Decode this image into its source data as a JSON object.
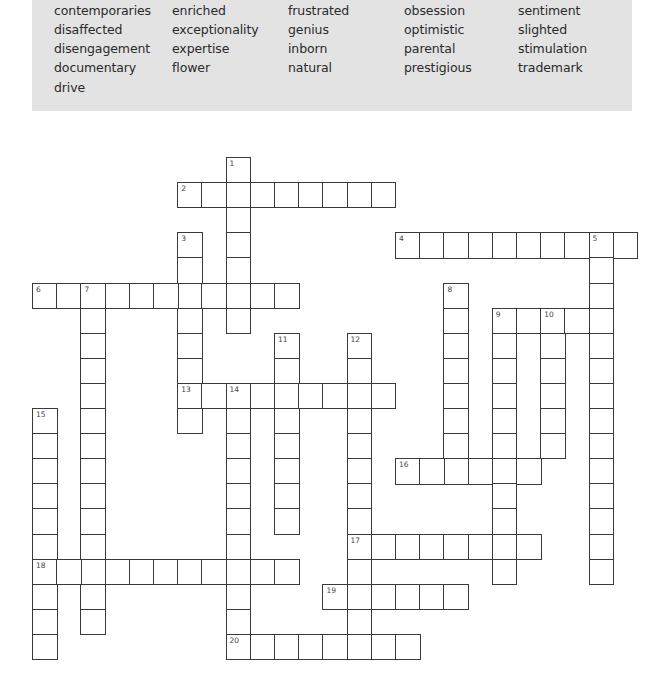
{
  "word_bank": {
    "columns": [
      [
        "contemporaries",
        "disaffected",
        "disengagement",
        "documentary",
        "drive"
      ],
      [
        "enriched",
        "exceptionality",
        "expertise",
        "flower"
      ],
      [
        "frustrated",
        "genius",
        "inborn",
        "natural"
      ],
      [
        "obsession",
        "optimistic",
        "parental",
        "prestigious"
      ],
      [
        "sentiment",
        "slighted",
        "stimulation",
        "trademark"
      ]
    ]
  },
  "crossword": {
    "grid": {
      "origin_x": 32,
      "origin_y": 157,
      "cell_w": 24.2,
      "cell_h": 25.1
    },
    "entries": [
      {
        "number": "1",
        "dir": "down",
        "row": 0,
        "col": 8,
        "length": 7
      },
      {
        "number": "2",
        "dir": "across",
        "row": 1,
        "col": 6,
        "length": 9
      },
      {
        "number": "3",
        "dir": "down",
        "row": 3,
        "col": 6,
        "length": 8
      },
      {
        "number": "4",
        "dir": "across",
        "row": 3,
        "col": 15,
        "length": 10
      },
      {
        "number": "5",
        "dir": "down",
        "row": 3,
        "col": 23,
        "length": 14
      },
      {
        "number": "6",
        "dir": "across",
        "row": 5,
        "col": 0,
        "length": 11
      },
      {
        "number": "7",
        "dir": "down",
        "row": 5,
        "col": 2,
        "length": 14
      },
      {
        "number": "8",
        "dir": "down",
        "row": 5,
        "col": 17,
        "length": 8
      },
      {
        "number": "9",
        "dir": "across",
        "row": 6,
        "col": 19,
        "length": 5
      },
      {
        "number": "9",
        "dir": "down",
        "row": 6,
        "col": 19,
        "length": 11
      },
      {
        "number": "10",
        "dir": "down",
        "row": 6,
        "col": 21,
        "length": 6
      },
      {
        "number": "11",
        "dir": "down",
        "row": 7,
        "col": 10,
        "length": 8
      },
      {
        "number": "12",
        "dir": "down",
        "row": 7,
        "col": 13,
        "length": 13
      },
      {
        "number": "13",
        "dir": "across",
        "row": 9,
        "col": 6,
        "length": 9
      },
      {
        "number": "14",
        "dir": "down",
        "row": 9,
        "col": 8,
        "length": 11
      },
      {
        "number": "15",
        "dir": "down",
        "row": 10,
        "col": 0,
        "length": 10
      },
      {
        "number": "16",
        "dir": "across",
        "row": 12,
        "col": 15,
        "length": 6
      },
      {
        "number": "17",
        "dir": "across",
        "row": 15,
        "col": 13,
        "length": 8
      },
      {
        "number": "18",
        "dir": "across",
        "row": 16,
        "col": 0,
        "length": 11
      },
      {
        "number": "19",
        "dir": "across",
        "row": 17,
        "col": 12,
        "length": 6
      },
      {
        "number": "20",
        "dir": "across",
        "row": 19,
        "col": 8,
        "length": 8
      }
    ]
  }
}
